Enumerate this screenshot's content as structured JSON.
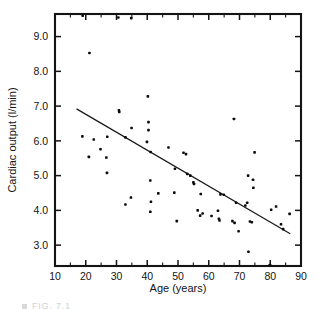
{
  "figure": {
    "caption_marker": "square-marker",
    "caption_text": "FIG. 7.1"
  },
  "chart_data": {
    "type": "scatter",
    "title": "",
    "subtitle": "",
    "xlabel": "Age (years)",
    "ylabel": "Cardiac output (l/min)",
    "xlim": [
      10,
      90
    ],
    "ylim": [
      2.4,
      9.65
    ],
    "xticks": [
      10,
      20,
      30,
      40,
      50,
      60,
      70,
      80,
      90
    ],
    "xtick_labels": [
      "10",
      "20",
      "30",
      "40",
      "50",
      "60",
      "70",
      "80",
      "90"
    ],
    "xminor_step": 5,
    "yticks": [
      3.0,
      4.0,
      5.0,
      6.0,
      7.0,
      8.0,
      9.0
    ],
    "ytick_labels": [
      "3.0",
      "4.0",
      "5.0",
      "6.0",
      "7.0",
      "8.0",
      "9.0"
    ],
    "grid": false,
    "legend": null,
    "frame": "box-all-sides-with-inward-ticks",
    "marker": {
      "shape": "filled-square-dot",
      "color": "#0b0b0b",
      "size_px": 2.6
    },
    "series": [
      {
        "name": "Cardiac output measurements",
        "points": [
          [
            19.0,
            9.6
          ],
          [
            21.2,
            8.53
          ],
          [
            30.6,
            9.55
          ],
          [
            34.8,
            9.53
          ],
          [
            40.2,
            7.28
          ],
          [
            30.8,
            6.88
          ],
          [
            30.9,
            6.83
          ],
          [
            40.4,
            6.54
          ],
          [
            34.9,
            6.37
          ],
          [
            40.4,
            6.31
          ],
          [
            68.2,
            6.63
          ],
          [
            18.9,
            6.13
          ],
          [
            27.0,
            6.12
          ],
          [
            32.9,
            6.1
          ],
          [
            22.6,
            6.04
          ],
          [
            39.9,
            5.97
          ],
          [
            46.9,
            5.81
          ],
          [
            24.8,
            5.76
          ],
          [
            41.1,
            5.68
          ],
          [
            51.8,
            5.66
          ],
          [
            52.6,
            5.62
          ],
          [
            74.9,
            5.67
          ],
          [
            21.0,
            5.54
          ],
          [
            26.7,
            5.52
          ],
          [
            49.0,
            5.2
          ],
          [
            26.9,
            5.08
          ],
          [
            53.0,
            5.05
          ],
          [
            54.0,
            5.0
          ],
          [
            72.8,
            5.0
          ],
          [
            74.4,
            4.88
          ],
          [
            41.0,
            4.86
          ],
          [
            55.0,
            4.81
          ],
          [
            55.2,
            4.76
          ],
          [
            74.5,
            4.65
          ],
          [
            43.6,
            4.49
          ],
          [
            48.8,
            4.51
          ],
          [
            57.4,
            4.47
          ],
          [
            63.8,
            4.46
          ],
          [
            64.9,
            4.45
          ],
          [
            34.7,
            4.37
          ],
          [
            41.2,
            4.25
          ],
          [
            68.9,
            4.22
          ],
          [
            72.5,
            4.22
          ],
          [
            32.9,
            4.17
          ],
          [
            71.9,
            4.14
          ],
          [
            81.9,
            4.11
          ],
          [
            80.3,
            4.02
          ],
          [
            56.4,
            4.0
          ],
          [
            63.0,
            3.99
          ],
          [
            41.0,
            3.96
          ],
          [
            58.0,
            3.91
          ],
          [
            86.3,
            3.9
          ],
          [
            57.2,
            3.85
          ],
          [
            60.9,
            3.84
          ],
          [
            63.3,
            3.76
          ],
          [
            63.5,
            3.71
          ],
          [
            67.7,
            3.69
          ],
          [
            49.6,
            3.69
          ],
          [
            73.4,
            3.68
          ],
          [
            74.0,
            3.66
          ],
          [
            68.4,
            3.64
          ],
          [
            83.5,
            3.6
          ],
          [
            84.2,
            3.46
          ],
          [
            69.7,
            3.4
          ],
          [
            72.9,
            2.81
          ],
          [
            79.9,
            2.43
          ]
        ]
      }
    ],
    "trendline": {
      "name": "regression line",
      "x_start": 17.0,
      "y_start": 6.92,
      "x_end": 86.5,
      "y_end": 3.33,
      "color": "#1a1a1a"
    }
  }
}
